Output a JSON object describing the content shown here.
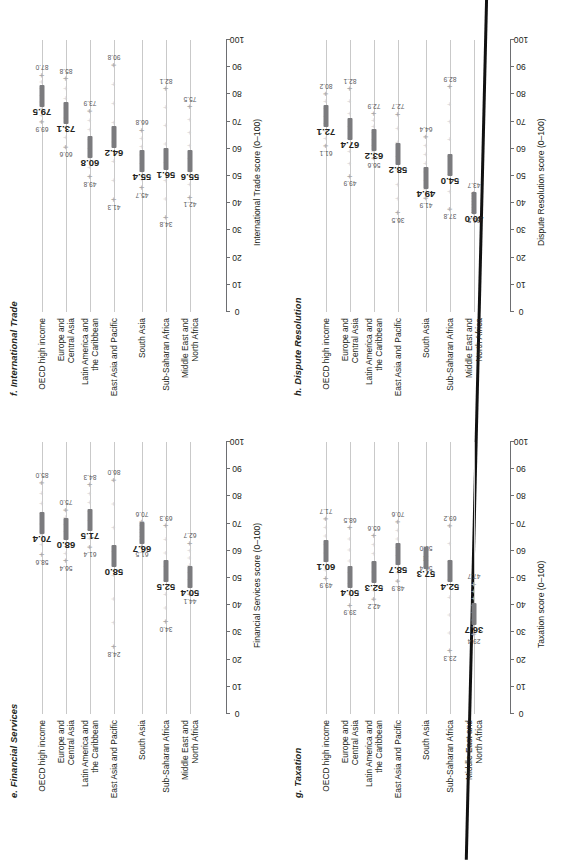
{
  "figure": {
    "orientation": "rotated-90-ccw",
    "regions": [
      "OECD high income",
      "Europe and\nCentral Asia",
      "Latin America and\nthe Caribbean",
      "East Asia and Pacific",
      "South Asia",
      "Sub-Saharan Africa",
      "Middle East and\nNorth Africa"
    ],
    "axis_ticks": [
      "0",
      "10",
      "20",
      "30",
      "40",
      "50",
      "60",
      "70",
      "80",
      "90",
      "100"
    ],
    "colors": {
      "bar": "#7b7b7e",
      "gridline": "#c9c9c9",
      "axis": "#6d6e71",
      "text": "#231f20",
      "minmax": "#58585b"
    }
  },
  "chart_data": [
    {
      "id": "e",
      "type": "bar",
      "title": "e. Financial Services",
      "xlabel": "Financial Services score (0–100)",
      "ylabel": "",
      "xlim": [
        0,
        100
      ],
      "categories": [
        "OECD high income",
        "Europe and\nCentral Asia",
        "Latin America and\nthe Caribbean",
        "East Asia and Pacific",
        "South Asia",
        "Sub-Saharan Africa",
        "Middle East and\nNorth Africa"
      ],
      "values": [
        70.4,
        68.0,
        71.5,
        58.0,
        66.7,
        52.5,
        50.4
      ],
      "min": [
        58.6,
        56.4,
        61.4,
        24.8,
        61.5,
        34.0,
        44.1
      ],
      "max": [
        85.0,
        75.0,
        84.3,
        86.0,
        70.6,
        69.3,
        62.7
      ],
      "grid": true,
      "legend": "none"
    },
    {
      "id": "f",
      "type": "bar",
      "title": "f. International Trade",
      "xlabel": "International Trade score (0–100)",
      "ylabel": "",
      "xlim": [
        0,
        100
      ],
      "categories": [
        "OECD high income",
        "Europe and\nCentral Asia",
        "Latin America and\nthe Caribbean",
        "East Asia and Pacific",
        "South Asia",
        "Sub-Saharan Africa",
        "Middle East and\nNorth Africa"
      ],
      "values": [
        79.5,
        73.1,
        60.8,
        64.2,
        55.4,
        56.1,
        55.6
      ],
      "min": [
        69.9,
        60.6,
        49.8,
        41.3,
        45.7,
        34.8,
        42.1
      ],
      "max": [
        87.0,
        85.8,
        73.9,
        90.8,
        66.8,
        82.1,
        75.5
      ],
      "grid": true,
      "legend": "none"
    },
    {
      "id": "g",
      "type": "bar",
      "title": "g. Taxation",
      "xlabel": "Taxation score (0–100)",
      "ylabel": "",
      "xlim": [
        0,
        100
      ],
      "categories": [
        "OECD high income",
        "Europe and\nCentral Asia",
        "Latin America and\nthe Caribbean",
        "East Asia and Pacific",
        "South Asia",
        "Sub-Saharan Africa",
        "Middle East and\nNorth Africa"
      ],
      "values": [
        60.1,
        50.4,
        52.3,
        58.7,
        57.3,
        52.4,
        36.7
      ],
      "min": [
        49.9,
        39.9,
        42.2,
        48.9,
        56.4,
        23.3,
        29.4
      ],
      "max": [
        71.7,
        68.5,
        65.6,
        70.6,
        58.0,
        69.2,
        47.7
      ],
      "grid": true,
      "legend": "none"
    },
    {
      "id": "h",
      "type": "bar",
      "title": "h. Dispute Resolution",
      "xlabel": "Dispute Resolution score (0–100)",
      "ylabel": "",
      "xlim": [
        0,
        100
      ],
      "categories": [
        "OECD high income",
        "Europe and\nCentral Asia",
        "Latin America and\nthe Caribbean",
        "East Asia and Pacific",
        "South Asia",
        "Sub-Saharan Africa",
        "Middle East and\nNorth Africa"
      ],
      "values": [
        72.1,
        67.4,
        63.2,
        58.2,
        49.4,
        54.0,
        40.0
      ],
      "min": [
        61.1,
        49.9,
        56.6,
        36.5,
        41.9,
        37.8,
        36.5
      ],
      "max": [
        80.2,
        82.1,
        72.9,
        72.7,
        64.4,
        82.9,
        43.7
      ],
      "grid": true,
      "legend": "none"
    }
  ]
}
